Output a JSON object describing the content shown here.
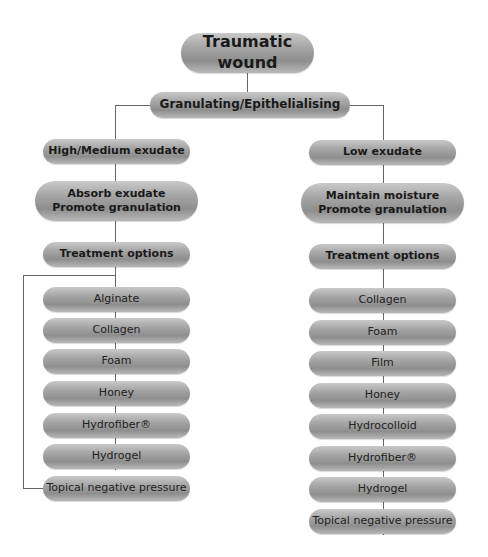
{
  "diagram": {
    "root": "Traumatic wound",
    "stage": "Granulating/Epithelialising",
    "left": {
      "exudate": "High/Medium exudate",
      "goal_line1": "Absorb exudate",
      "goal_line2": "Promote granulation",
      "treatment_header": "Treatment options",
      "options": [
        "Alginate",
        "Collagen",
        "Foam",
        "Honey",
        "Hydrofiber®",
        "Hydrogel",
        "Topical negative pressure"
      ]
    },
    "right": {
      "exudate": "Low exudate",
      "goal_line1": "Maintain moisture",
      "goal_line2": "Promote granulation",
      "treatment_header": "Treatment options",
      "options": [
        "Collagen",
        "Foam",
        "Film",
        "Honey",
        "Hydrocolloid",
        "Hydrofiber®",
        "Hydrogel",
        "Topical negative pressure"
      ]
    }
  }
}
